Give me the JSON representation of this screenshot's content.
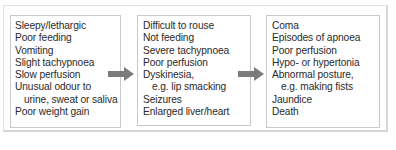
{
  "diagram": {
    "type": "flow",
    "direction": "left-to-right",
    "arrow_color": "#7b7b7b",
    "stages": [
      {
        "items": [
          {
            "text": "Sleepy/lethargic",
            "indent": false
          },
          {
            "text": "Poor feeding",
            "indent": false
          },
          {
            "text": "Vomiting",
            "indent": false
          },
          {
            "text": "Slight tachypnoea",
            "indent": false
          },
          {
            "text": "Slow perfusion",
            "indent": false
          },
          {
            "text": "Unusual odour to",
            "indent": false
          },
          {
            "text": "urine, sweat or saliva",
            "indent": true
          },
          {
            "text": "Poor weight gain",
            "indent": false
          }
        ]
      },
      {
        "items": [
          {
            "text": "Difficult to rouse",
            "indent": false
          },
          {
            "text": "Not feeding",
            "indent": false
          },
          {
            "text": "Severe tachypnoea",
            "indent": false
          },
          {
            "text": "Poor perfusion",
            "indent": false
          },
          {
            "text": "Dyskinesia,",
            "indent": false
          },
          {
            "text": "e.g. lip smacking",
            "indent": true
          },
          {
            "text": "Seizures",
            "indent": false
          },
          {
            "text": "Enlarged liver/heart",
            "indent": false
          }
        ]
      },
      {
        "items": [
          {
            "text": "Coma",
            "indent": false
          },
          {
            "text": "Episodes of apnoea",
            "indent": false
          },
          {
            "text": "Poor perfusion",
            "indent": false
          },
          {
            "text": "Hypo- or hypertonia",
            "indent": false
          },
          {
            "text": "Abnormal posture,",
            "indent": false
          },
          {
            "text": "e.g.  making fists",
            "indent": true
          },
          {
            "text": "Jaundice",
            "indent": false
          },
          {
            "text": "Death",
            "indent": false
          }
        ]
      }
    ]
  }
}
